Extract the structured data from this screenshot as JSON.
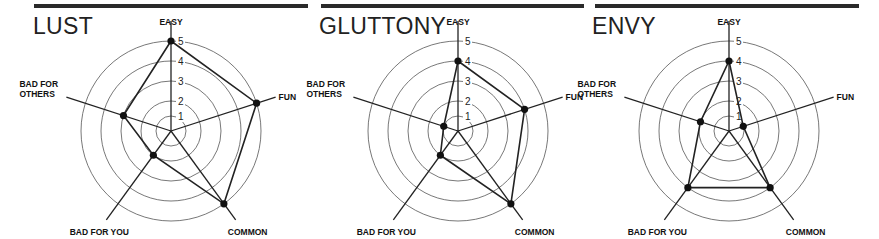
{
  "chart_data": [
    {
      "type": "radar",
      "title": "LUST",
      "axes": [
        "EASY",
        "FUN",
        "COMMON",
        "BAD FOR YOU",
        "BAD FOR OTHERS"
      ],
      "values": [
        5,
        5,
        5,
        2,
        3
      ],
      "ticks": [
        1,
        2,
        3,
        4,
        5
      ],
      "range": [
        0,
        5
      ],
      "grid": true,
      "legend": null
    },
    {
      "type": "radar",
      "title": "GLUTTONY",
      "axes": [
        "EASY",
        "FUN",
        "COMMON",
        "BAD FOR YOU",
        "BAD FOR OTHERS"
      ],
      "values": [
        4,
        4,
        5,
        2,
        1
      ],
      "ticks": [
        1,
        2,
        3,
        4,
        5
      ],
      "range": [
        0,
        5
      ],
      "grid": true,
      "legend": null
    },
    {
      "type": "radar",
      "title": "ENVY",
      "axes": [
        "EASY",
        "FUN",
        "COMMON",
        "BAD FOR YOU",
        "BAD FOR OTHERS"
      ],
      "values": [
        4,
        1,
        4,
        4,
        2
      ],
      "ticks": [
        1,
        2,
        3,
        4,
        5
      ],
      "range": [
        0,
        5
      ],
      "grid": true,
      "legend": null
    }
  ],
  "panels": [
    {
      "title": "LUST"
    },
    {
      "title": "GLUTTONY"
    },
    {
      "title": "ENVY"
    }
  ],
  "axis_labels": {
    "easy": "EASY",
    "fun": "FUN",
    "common": "COMMON",
    "bad_for_you": "BAD FOR YOU",
    "bad_for_others_line1": "BAD FOR",
    "bad_for_others_line2": "OTHERS"
  },
  "ticks": [
    "1",
    "2",
    "3",
    "4",
    "5"
  ],
  "colors": {
    "line": "#222222",
    "grid": "#555555",
    "bar": "#2a2a2a"
  }
}
